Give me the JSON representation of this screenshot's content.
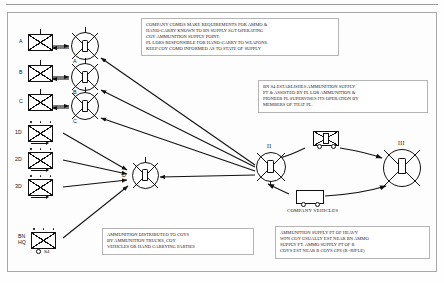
{
  "diagram": {
    "title_hidden": "",
    "companies": [
      {
        "label": "A",
        "type": "rifle-company"
      },
      {
        "label": "B",
        "type": "rifle-company"
      },
      {
        "label": "C",
        "type": "rifle-company"
      },
      {
        "label": "1D",
        "type": "weapons-platoon"
      },
      {
        "label": "2D",
        "type": "weapons-platoon"
      },
      {
        "label": "3D",
        "type": "weapons-platoon"
      }
    ],
    "bn_hq": {
      "line1": "BN",
      "line2": "HQ",
      "marking": "S4"
    },
    "supply_points": [
      {
        "label": "A",
        "echelon": ""
      },
      {
        "label": "B",
        "echelon": ""
      },
      {
        "label": "C",
        "echelon": ""
      },
      {
        "label": "D",
        "echelon": ""
      },
      {
        "label": "",
        "echelon": "II"
      },
      {
        "label": "",
        "echelon": "III"
      }
    ],
    "vehicles_label": "COMPANY VEHICLES",
    "notes": [
      {
        "name": "company-comds-note",
        "lines": [
          "COMPANY COMDS MAKE REQUIREMENTS FOR AMMO &",
          "HAND-CARRY KNOWN TO BN SUPPLY SGT OPERATING",
          "COY AMMUNITION SUPPLY POINT.",
          "PL LDRS RESPONSIBLE FOR HAND-CARRY TO WEAPONS.",
          "KEEP COY COMD INFORMED AS TO STATE OF SUPPLY"
        ]
      },
      {
        "name": "bn-s4-note",
        "lines": [
          "BN S4 ESTABLISHES AMMUNITION SUPPLY",
          "PT & ASSISTED BY PL LDR AMMUNITION &",
          "PIONEER PL SUPERVISES ITS OPERATION BY",
          "MEMBERS OF THAT PL."
        ]
      },
      {
        "name": "distribution-note",
        "lines": [
          "AMMUNITION DISTRIBUTED TO COYS",
          "BY AMMUNITION TRUCKS, COY",
          "VEHICLES OR HAND CARRYING PARTIES"
        ]
      },
      {
        "name": "heavy-wpn-note",
        "lines": [
          "AMMUNITION SUPPLY PT OF HEAVY",
          "WPN COY USUALLY EST NEAR BN AMMO",
          "SUPPLY PT. AMMO SUPPLY PT OF R",
          "COYS EST NEAR R COYS CPS   (R=RIFLE)"
        ]
      }
    ]
  }
}
